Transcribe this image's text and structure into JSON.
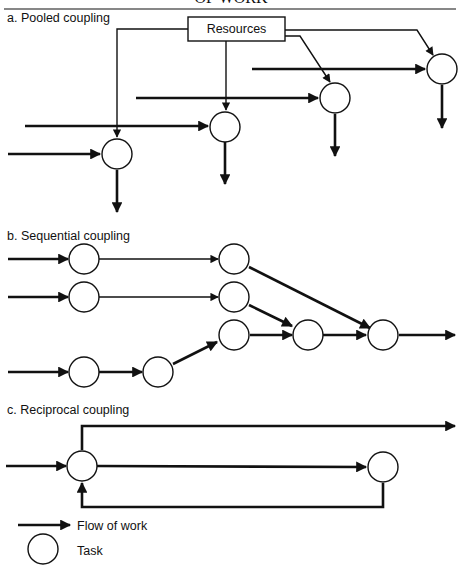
{
  "header": {
    "title_fragment": "OF WORK"
  },
  "sections": {
    "pooled": {
      "label": "a. Pooled coupling",
      "resource_box": "Resources"
    },
    "sequential": {
      "label": "b. Sequential coupling"
    },
    "reciprocal": {
      "label": "c. Reciprocal coupling"
    }
  },
  "legend": {
    "arrow_label": "Flow of work",
    "circle_label": "Task"
  },
  "colors": {
    "ink": "#111111",
    "background": "#ffffff"
  }
}
